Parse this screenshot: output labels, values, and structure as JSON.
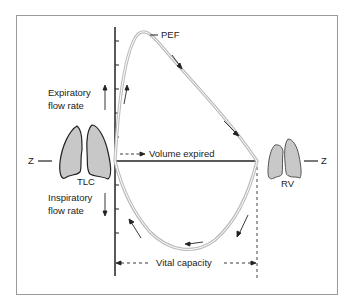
{
  "labels": {
    "pef": "PEF",
    "expiratory_line1": "Expiratory",
    "expiratory_line2": "flow rate",
    "inspiratory_line1": "Inspiratory",
    "inspiratory_line2": "flow rate",
    "volume_expired": "Volume expired",
    "vital_capacity": "Vital capacity",
    "tlc": "TLC",
    "rv": "RV",
    "z_left": "Z",
    "z_right": "Z"
  },
  "colors": {
    "lung_fill": "#c8c8c8",
    "curve": "#bdbdbd",
    "axis": "#222222",
    "frame": "#9a9a9a"
  }
}
